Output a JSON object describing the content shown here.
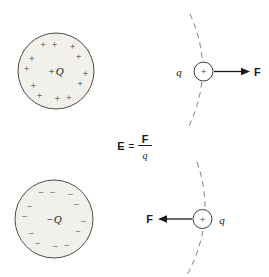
{
  "colors": {
    "sphere_fill": "#f1f0ea",
    "sphere_stroke": "#4b4b4b",
    "mark": "#3a3a3a",
    "dash": "#7f7f7f",
    "ink": "#1a1a1a"
  },
  "positive_sphere": {
    "sign": "+",
    "label": "Q",
    "ring_symbol": "+",
    "ring_count": 12
  },
  "negative_sphere": {
    "sign": "−",
    "label": "Q",
    "ring_symbol": "−",
    "ring_count": 12
  },
  "top_test_charge": {
    "symbol": "+",
    "label": "q",
    "force_label": "F",
    "force_direction": "right"
  },
  "bottom_test_charge": {
    "symbol": "+",
    "label": "q",
    "force_label": "F",
    "force_direction": "left"
  },
  "equation": {
    "lhs": "E",
    "rel": "=",
    "numerator": "F",
    "denominator": "q"
  }
}
